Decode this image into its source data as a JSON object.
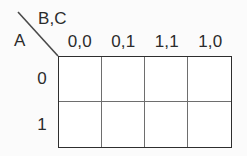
{
  "diagram": {
    "type": "karnaugh-map",
    "row_variable_label": "A",
    "column_variable_label": "B,C",
    "column_headers": [
      "0,0",
      "0,1",
      "1,1",
      "1,0"
    ],
    "row_headers": [
      "0",
      "1"
    ],
    "cells": [
      [
        "",
        "",
        "",
        ""
      ],
      [
        "",
        "",
        "",
        ""
      ]
    ],
    "colors": {
      "background": "#fbfbfb",
      "grid_fill": "#ffffff",
      "outer_border": "#2e2e2e",
      "inner_line": "#6e6e6e",
      "diagonal_line": "#4a4a4a",
      "text": "#2b2b2b"
    }
  }
}
